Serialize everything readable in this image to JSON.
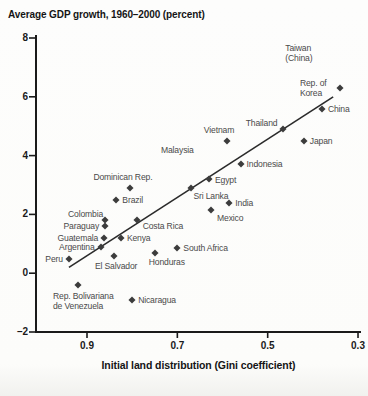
{
  "chart_data": {
    "type": "scatter",
    "title": "Average GDP growth, 1960–2000 (percent)",
    "xlabel": "Initial land distribution (Gini coefficient)",
    "ylabel": "Average GDP growth (percent)",
    "x_reversed": true,
    "xlim": [
      0.97,
      0.29
    ],
    "ylim": [
      -2,
      8
    ],
    "grid": false,
    "x_ticks": [
      {
        "value": 0.9,
        "label": "0.9"
      },
      {
        "value": 0.7,
        "label": "0.7"
      },
      {
        "value": 0.5,
        "label": "0.5"
      },
      {
        "value": 0.3,
        "label": "0.3"
      }
    ],
    "y_ticks": [
      {
        "value": 8,
        "label": "8"
      },
      {
        "value": 6,
        "label": "6"
      },
      {
        "value": 4,
        "label": "4"
      },
      {
        "value": 2,
        "label": "2"
      },
      {
        "value": 0,
        "label": "0"
      },
      {
        "value": -2,
        "label": "–2"
      }
    ],
    "trendline": {
      "x1": 0.94,
      "y1": 0.2,
      "x2": 0.355,
      "y2": 6.0
    },
    "points": [
      {
        "label": "Taiwan (China)",
        "gini": 0.4,
        "growth": 7.5,
        "marker": false,
        "side": "center"
      },
      {
        "label": "Rep. of Korea",
        "gini": 0.34,
        "growth": 6.3,
        "marker": true,
        "side": "left"
      },
      {
        "label": "China",
        "gini": 0.38,
        "growth": 5.6,
        "marker": true,
        "side": "right"
      },
      {
        "label": "Thailand",
        "gini": 0.465,
        "growth": 4.9,
        "marker": true,
        "side": "left",
        "dy": -6
      },
      {
        "label": "Japan",
        "gini": 0.42,
        "growth": 4.5,
        "marker": true,
        "side": "right"
      },
      {
        "label": "Vietnam",
        "gini": 0.59,
        "growth": 4.5,
        "marker": true,
        "side": "above",
        "dx": -8
      },
      {
        "label": "Malaysia",
        "gini": 0.7,
        "growth": 4.2,
        "marker": false,
        "side": "center"
      },
      {
        "label": "Indonesia",
        "gini": 0.56,
        "growth": 3.7,
        "marker": true,
        "side": "right"
      },
      {
        "label": "Egypt",
        "gini": 0.63,
        "growth": 3.2,
        "marker": true,
        "side": "right",
        "dy": 1
      },
      {
        "label": "Dominican Rep.",
        "gini": 0.805,
        "growth": 2.9,
        "marker": true,
        "side": "above",
        "dx": -7
      },
      {
        "label": "Sri Lanka",
        "gini": 0.67,
        "growth": 2.9,
        "marker": true,
        "side": "below",
        "dx": 20,
        "dy": 3
      },
      {
        "label": "Brazil",
        "gini": 0.835,
        "growth": 2.5,
        "marker": true,
        "side": "right"
      },
      {
        "label": "India",
        "gini": 0.585,
        "growth": 2.4,
        "marker": true,
        "side": "right"
      },
      {
        "label": "Mexico",
        "gini": 0.625,
        "growth": 2.15,
        "marker": true,
        "side": "below",
        "dx": 19,
        "dy": 3
      },
      {
        "label": "Costa Rica",
        "gini": 0.79,
        "growth": 1.8,
        "marker": true,
        "side": "right",
        "dy": 6
      },
      {
        "label": "Colombia",
        "gini": 0.86,
        "growth": 1.8,
        "marker": true,
        "side": "left",
        "dx": 4,
        "dy": -6
      },
      {
        "label": "Paraguay",
        "gini": 0.86,
        "growth": 1.6,
        "marker": true,
        "side": "left"
      },
      {
        "label": "Guatemala",
        "gini": 0.862,
        "growth": 1.2,
        "marker": true,
        "side": "left"
      },
      {
        "label": "Kenya",
        "gini": 0.825,
        "growth": 1.2,
        "marker": true,
        "side": "right"
      },
      {
        "label": "Argentina",
        "gini": 0.87,
        "growth": 0.9,
        "marker": true,
        "side": "left"
      },
      {
        "label": "South Africa",
        "gini": 0.7,
        "growth": 0.85,
        "marker": true,
        "side": "right"
      },
      {
        "label": "Honduras",
        "gini": 0.75,
        "growth": 0.7,
        "marker": true,
        "side": "below",
        "dx": 12,
        "dy": 4
      },
      {
        "label": "El Salvador",
        "gini": 0.84,
        "growth": 0.6,
        "marker": true,
        "side": "below",
        "dx": 2,
        "dy": 5
      },
      {
        "label": "Peru",
        "gini": 0.94,
        "growth": 0.5,
        "marker": true,
        "side": "left"
      },
      {
        "label": "Rep. Bolivariana\nde Venezuela",
        "gini": 0.92,
        "growth": -0.4,
        "marker": true,
        "side": "below-left",
        "dx": -25,
        "dy": 6
      },
      {
        "label": "Nicaragua",
        "gini": 0.8,
        "growth": -0.9,
        "marker": true,
        "side": "right"
      }
    ]
  },
  "colors": {
    "ink": "#1a1a1a",
    "marker": "#3c3c3c",
    "label_text": "#4a4a4a",
    "trendline": "#2b2b2b",
    "paper": "#fcfcfa"
  }
}
